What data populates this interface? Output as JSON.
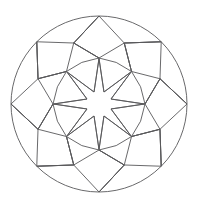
{
  "figure": {
    "background_color": "#ffffff",
    "stroke_color": "#58585a",
    "stroke_width": 0.9,
    "width": 198,
    "height": 207
  },
  "geometry": {
    "center": {
      "x": 99,
      "y": 104
    },
    "symmetry_order": 8,
    "rotation_offset_deg": -90,
    "rings": [
      {
        "name": "outer-circle",
        "shape": "circle",
        "radius": 88,
        "label": "Outer circle"
      },
      {
        "name": "octagon-ring",
        "shape": "polygon",
        "radius": 66,
        "vertices": 8,
        "phase_deg": 0,
        "label": "Inscribed octagon"
      },
      {
        "name": "kite-ring",
        "shape": "polygon",
        "radius": 46,
        "vertices": 8,
        "phase_deg": 22.5,
        "label": "Mid kite ring"
      },
      {
        "name": "star-outer",
        "shape": "star-points",
        "radius": 45,
        "vertices": 8,
        "phase_deg": 0,
        "label": "Star point tips"
      },
      {
        "name": "star-inner",
        "shape": "star-valleys",
        "radius": 13,
        "vertices": 8,
        "phase_deg": 22.5,
        "label": "Star inner valleys"
      }
    ],
    "elements": [
      {
        "name": "outer-circle",
        "count": 1
      },
      {
        "name": "outer-petal",
        "count": 8
      },
      {
        "name": "outer-quad",
        "count": 8
      },
      {
        "name": "mid-kite",
        "count": 8
      },
      {
        "name": "center-star",
        "count": 1
      }
    ]
  }
}
